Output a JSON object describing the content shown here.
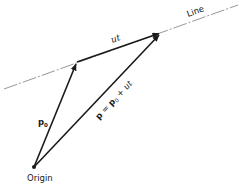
{
  "diagram": {
    "labels": {
      "line": "Line",
      "direction": "ut",
      "start_vector": "p",
      "start_vector_subscript": "0",
      "sum_vector_lhs": "p",
      "sum_vector_eq": " = ",
      "sum_vector_p": "p",
      "sum_vector_p_sub": "0",
      "sum_vector_plus": " + ",
      "sum_vector_ut": "ut",
      "origin": "Origin"
    },
    "points": [
      "origin",
      "p0",
      "p"
    ],
    "vectors": [
      {
        "name": "p0",
        "from": "origin",
        "to": "p0"
      },
      {
        "name": "ut",
        "from": "p0",
        "to": "p"
      },
      {
        "name": "p",
        "from": "origin",
        "to": "p"
      }
    ],
    "colors": {
      "ink": "#1a1a1a",
      "line": "#8a8a8a"
    }
  }
}
